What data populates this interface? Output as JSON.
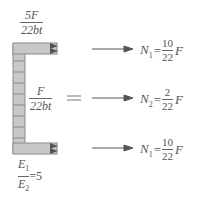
{
  "colors": {
    "member_fill": "#c8c8c8",
    "member_stroke": "#8a8a8a",
    "arrow": "#555555",
    "text": "#555555"
  },
  "labels": {
    "top_stress": {
      "numerator": "5F",
      "denominator": "22bt"
    },
    "middle_stress": {
      "numerator": "F",
      "denominator": "22bt"
    },
    "equals_sign": "=",
    "modulus_ratio": {
      "numerator": "E",
      "numerator_sub": "1",
      "denominator": "E",
      "denominator_sub": "2",
      "value": "=5"
    }
  },
  "forces": [
    {
      "symbol": "N",
      "subscript": "1",
      "eq": "=",
      "numerator": "10",
      "denominator": "22",
      "var": "F"
    },
    {
      "symbol": "N",
      "subscript": "2",
      "eq": "=",
      "numerator": "2",
      "denominator": "22",
      "var": "F"
    },
    {
      "symbol": "N",
      "subscript": "1",
      "eq": "=",
      "numerator": "10",
      "denominator": "22",
      "var": "F"
    }
  ]
}
